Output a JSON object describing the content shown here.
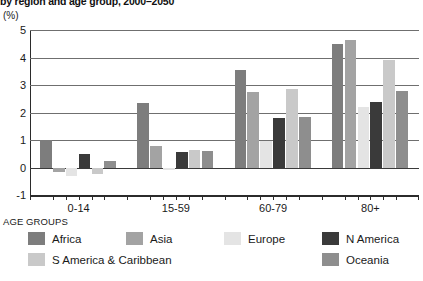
{
  "chart_data": {
    "type": "bar",
    "title": "by region and age group, 2000–2050",
    "subtitle": "",
    "unit_label": "(%)",
    "xlabel": "AGE GROUPS",
    "ylabel": "",
    "categories": [
      "0-14",
      "15-59",
      "60-79",
      "80+"
    ],
    "ylim": [
      -1,
      5
    ],
    "y_ticks": [
      5,
      4,
      3,
      2,
      1,
      0,
      -1
    ],
    "grid": true,
    "legend_position": "bottom",
    "series": [
      {
        "name": "Africa",
        "color": "#7d7d7d",
        "values": [
          1.0,
          2.35,
          3.55,
          4.5
        ]
      },
      {
        "name": "Asia",
        "color": "#a3a3a3",
        "values": [
          -0.15,
          0.8,
          2.75,
          4.65
        ]
      },
      {
        "name": "Europe",
        "color": "#e4e4e4",
        "values": [
          -0.3,
          -0.1,
          0.95,
          2.2
        ]
      },
      {
        "name": "N America",
        "color": "#3a3a3a",
        "values": [
          0.5,
          0.55,
          1.8,
          2.4
        ]
      },
      {
        "name": "S America & Caribbean",
        "color": "#c9c9c9",
        "values": [
          -0.25,
          0.65,
          2.85,
          3.9
        ]
      },
      {
        "name": "Oceania",
        "color": "#8e8e8e",
        "values": [
          0.25,
          0.6,
          1.85,
          2.8
        ]
      }
    ]
  }
}
